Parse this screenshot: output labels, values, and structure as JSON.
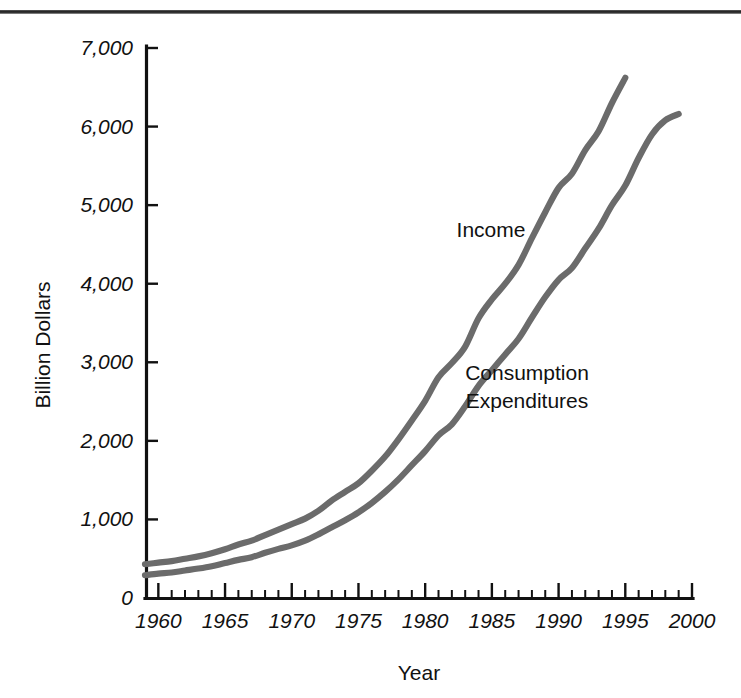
{
  "figure": {
    "background": "#ffffff",
    "top_rule_color": "#242424",
    "line_color": "#6b6b6b",
    "axis_color": "#111111"
  },
  "chart_data": {
    "type": "line",
    "title": "",
    "xlabel": "Year",
    "ylabel": "Billion Dollars",
    "xlim": [
      1959,
      2000
    ],
    "ylim": [
      0,
      7000
    ],
    "grid": false,
    "legend": "inline-labels",
    "x_ticks_major": [
      1960,
      1965,
      1970,
      1975,
      1980,
      1985,
      1990,
      1995,
      2000
    ],
    "x_tick_labels": [
      "1960",
      "1965",
      "1970",
      "1975",
      "1980",
      "1985",
      "1990",
      "1995",
      "2000"
    ],
    "x_minor_tick_step": 1,
    "y_ticks": [
      0,
      1000,
      2000,
      3000,
      4000,
      5000,
      6000,
      7000
    ],
    "y_tick_labels": [
      "0",
      "1,000",
      "2,000",
      "3,000",
      "4,000",
      "5,000",
      "6,000",
      "7,000"
    ],
    "x": [
      1959,
      1960,
      1961,
      1962,
      1963,
      1964,
      1965,
      1966,
      1967,
      1968,
      1969,
      1970,
      1971,
      1972,
      1973,
      1974,
      1975,
      1976,
      1977,
      1978,
      1979,
      1980,
      1981,
      1982,
      1983,
      1984,
      1985,
      1986,
      1987,
      1988,
      1989,
      1990,
      1991,
      1992,
      1993,
      1994,
      1995,
      1996,
      1997,
      1998,
      1999
    ],
    "series": [
      {
        "name": "Income",
        "label": "Income",
        "color": "#6b6b6b",
        "values": [
          430,
          450,
          470,
          500,
          530,
          570,
          620,
          680,
          730,
          800,
          870,
          940,
          1010,
          1110,
          1240,
          1350,
          1460,
          1620,
          1800,
          2020,
          2260,
          2510,
          2810,
          2990,
          3200,
          3560,
          3800,
          4000,
          4240,
          4580,
          4910,
          5220,
          5400,
          5700,
          5940,
          6300,
          6620,
          6620,
          6620,
          6620,
          6620
        ]
      },
      {
        "name": "Consumption Expenditures",
        "label": "Consumption Expenditures",
        "color": "#6b6b6b",
        "values": [
          290,
          310,
          325,
          350,
          375,
          405,
          445,
          485,
          520,
          575,
          625,
          670,
          730,
          810,
          900,
          990,
          1090,
          1210,
          1350,
          1510,
          1690,
          1870,
          2070,
          2210,
          2440,
          2700,
          2900,
          3100,
          3300,
          3570,
          3830,
          4050,
          4200,
          4450,
          4700,
          5000,
          5250,
          5600,
          5900,
          6080,
          6160
        ]
      }
    ],
    "annotations": [
      {
        "text": "Income",
        "x_px": 491,
        "y_px": 237
      },
      {
        "text": "Consumption",
        "x_px": 527,
        "y_px": 380
      },
      {
        "text": "Expenditures",
        "x_px": 527,
        "y_px": 408
      }
    ]
  },
  "geometry": {
    "plot_left_px": 145,
    "plot_bottom_px": 598,
    "plot_top_px": 48,
    "plot_right_px": 692,
    "x_origin_year": 1959,
    "px_per_year": 13,
    "px_per_1000": 78.6
  }
}
